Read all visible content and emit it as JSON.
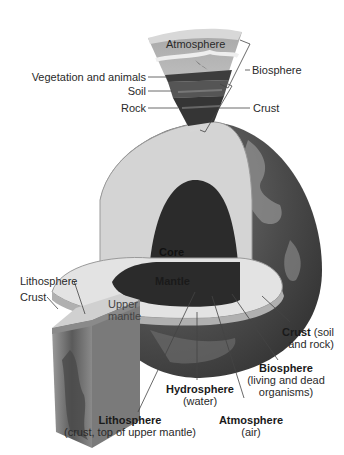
{
  "diagram": {
    "title": "",
    "colors": {
      "background": "#ffffff",
      "core": "#2b2b2b",
      "mantle_face": "#d9d9d9",
      "mantle_rim": "#c4c4c4",
      "surface_dark": "#3e3e3e",
      "surface_light": "#8a8a8a",
      "sky": "#bcbcbc",
      "soil": "#4a4a4a",
      "leader_line": "#444444"
    },
    "wedge_labels": {
      "atmosphere": "Atmosphere",
      "vegetation": "Vegetation and animals",
      "soil": "Soil",
      "rock": "Rock",
      "biosphere": "Biosphere",
      "crust": "Crust"
    },
    "globe_labels": {
      "core": "Core",
      "mantle": "Mantle"
    },
    "block_labels": {
      "lithosphere": "Lithosphere",
      "crust": "Crust",
      "upper_mantle_line1": "Upper",
      "upper_mantle_line2": "mantle"
    },
    "bottom_labels": {
      "crust": {
        "bold": "Crust",
        "rest": " (soil",
        "line2": "and rock)"
      },
      "biosphere": {
        "bold": "Biosphere",
        "line2": "(living and dead",
        "line3": "organisms)"
      },
      "hydrosphere": {
        "bold": "Hydrosphere",
        "line2": "(water)"
      },
      "atmosphere": {
        "bold": "Atmosphere",
        "line2": "(air)"
      },
      "lithosphere": {
        "bold": "Lithosphere",
        "line2": "(crust, top of upper mantle)"
      }
    }
  }
}
